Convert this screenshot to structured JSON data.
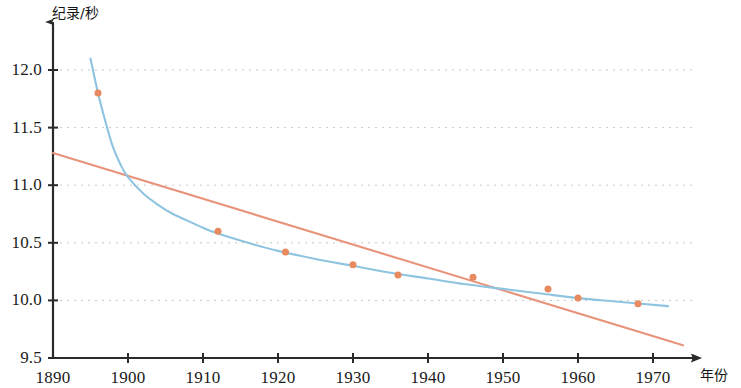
{
  "chart_data": {
    "type": "scatter",
    "title": "",
    "subtitle": "",
    "xlabel": "年份",
    "ylabel": "纪录/秒",
    "xlim": [
      1890,
      1974
    ],
    "ylim": [
      9.5,
      12.15
    ],
    "xticks": [
      1890,
      1900,
      1910,
      1920,
      1930,
      1940,
      1950,
      1960,
      1970
    ],
    "xtick_labels": [
      "1890",
      "1900",
      "1910",
      "1920",
      "1930",
      "1940",
      "1950",
      "1960",
      "1970"
    ],
    "yticks": [
      9.5,
      10.0,
      10.5,
      11.0,
      11.5,
      12.0
    ],
    "ytick_labels": [
      "9.5",
      "10.0",
      "10.5",
      "11.0",
      "11.5",
      "12.0"
    ],
    "grid": "horizontal-dotted",
    "legend": "none",
    "points": [
      {
        "x": 1896,
        "y": 11.8
      },
      {
        "x": 1912,
        "y": 10.6
      },
      {
        "x": 1921,
        "y": 10.42
      },
      {
        "x": 1930,
        "y": 10.31
      },
      {
        "x": 1936,
        "y": 10.22
      },
      {
        "x": 1946,
        "y": 10.2
      },
      {
        "x": 1956,
        "y": 10.1
      },
      {
        "x": 1960,
        "y": 10.02
      },
      {
        "x": 1968,
        "y": 9.97
      }
    ],
    "series": [
      {
        "name": "curve-fit",
        "type": "line",
        "color": "#8ec4e0",
        "points": [
          {
            "x": 1895.0,
            "y": 12.1
          },
          {
            "x": 1896.0,
            "y": 11.8
          },
          {
            "x": 1897.0,
            "y": 11.55
          },
          {
            "x": 1898.0,
            "y": 11.33
          },
          {
            "x": 1899.0,
            "y": 11.18
          },
          {
            "x": 1900.0,
            "y": 11.07
          },
          {
            "x": 1902.0,
            "y": 10.93
          },
          {
            "x": 1904.0,
            "y": 10.83
          },
          {
            "x": 1906.0,
            "y": 10.75
          },
          {
            "x": 1908.0,
            "y": 10.69
          },
          {
            "x": 1910.0,
            "y": 10.63
          },
          {
            "x": 1912.0,
            "y": 10.58
          },
          {
            "x": 1916.0,
            "y": 10.5
          },
          {
            "x": 1920.0,
            "y": 10.43
          },
          {
            "x": 1925.0,
            "y": 10.36
          },
          {
            "x": 1930.0,
            "y": 10.3
          },
          {
            "x": 1935.0,
            "y": 10.24
          },
          {
            "x": 1940.0,
            "y": 10.19
          },
          {
            "x": 1945.0,
            "y": 10.14
          },
          {
            "x": 1950.0,
            "y": 10.1
          },
          {
            "x": 1955.0,
            "y": 10.06
          },
          {
            "x": 1960.0,
            "y": 10.02
          },
          {
            "x": 1965.0,
            "y": 9.99
          },
          {
            "x": 1972.0,
            "y": 9.95
          }
        ]
      },
      {
        "name": "linear-fit",
        "type": "line",
        "color": "#e8937a",
        "points": [
          {
            "x": 1890.0,
            "y": 11.28
          },
          {
            "x": 1974.0,
            "y": 9.61
          }
        ]
      }
    ],
    "marker_color": "#e78a60",
    "marker_size": 7
  },
  "axes": {
    "y_title": "纪录/秒",
    "x_title": "年份",
    "axis_color": "#2a2a2a",
    "grid_color": "#c8c8c8"
  }
}
